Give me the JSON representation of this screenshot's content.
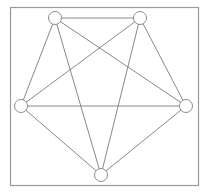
{
  "diagram": {
    "type": "graph",
    "title": "",
    "frame": {
      "x": 10,
      "y": 7,
      "width": 188,
      "height": 178,
      "stroke": "#9a9a9a"
    },
    "node_style": {
      "radius": 6.5,
      "fill": "#ffffff",
      "stroke": "#8c8c8c"
    },
    "edge_style": {
      "stroke": "#7a7a7a",
      "width": 0.9
    },
    "nodes": [
      {
        "id": "n1",
        "label": "",
        "x": 55,
        "y": 18
      },
      {
        "id": "n2",
        "label": "",
        "x": 140,
        "y": 18
      },
      {
        "id": "n3",
        "label": "",
        "x": 21,
        "y": 106
      },
      {
        "id": "n4",
        "label": "",
        "x": 186,
        "y": 106
      },
      {
        "id": "n5",
        "label": "",
        "x": 101,
        "y": 175
      }
    ],
    "edges": [
      {
        "from": "n1",
        "to": "n2"
      },
      {
        "from": "n1",
        "to": "n3"
      },
      {
        "from": "n1",
        "to": "n4"
      },
      {
        "from": "n1",
        "to": "n5"
      },
      {
        "from": "n2",
        "to": "n3"
      },
      {
        "from": "n2",
        "to": "n4"
      },
      {
        "from": "n2",
        "to": "n5"
      },
      {
        "from": "n3",
        "to": "n4"
      },
      {
        "from": "n3",
        "to": "n5"
      },
      {
        "from": "n4",
        "to": "n5"
      }
    ]
  }
}
